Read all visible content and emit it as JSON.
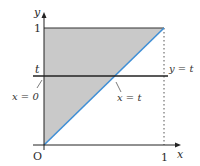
{
  "diagram": {
    "colors": {
      "shading": "#c9c9c9",
      "diagonal": "#3f8fd6",
      "axes": "#222222",
      "lines": "#333333",
      "dotted": "#555555"
    },
    "labels": {
      "y_axis": "y",
      "x_axis": "x",
      "origin": "O",
      "y_one": "1",
      "x_one": "1",
      "t_tick": "t",
      "line_y_t": "y = t",
      "line_x_t": "x = t",
      "line_x_0": "x = 0"
    }
  }
}
